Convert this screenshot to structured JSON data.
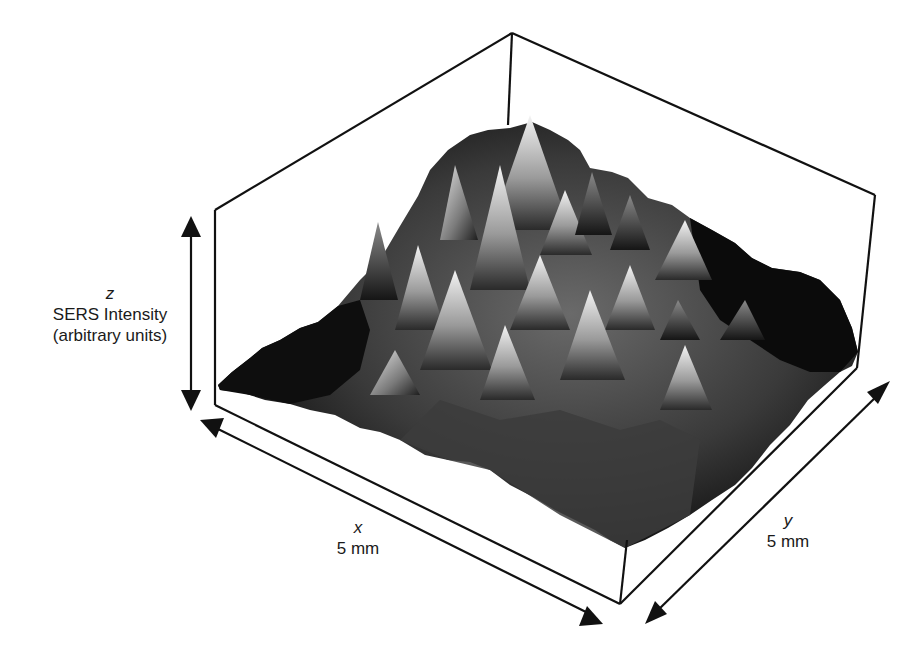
{
  "figure": {
    "type": "3d-surface-plot",
    "colors": {
      "box_line": "#111111",
      "surface_dark": "#0a0a0a",
      "surface_light": "#f2f2f2",
      "background": "#ffffff"
    }
  },
  "axes": {
    "z": {
      "variable": "z",
      "title": "SERS Intensity",
      "unit": "(arbitrary units)"
    },
    "x": {
      "variable": "x",
      "extent": "5 mm"
    },
    "y": {
      "variable": "y",
      "extent": "5 mm"
    }
  }
}
